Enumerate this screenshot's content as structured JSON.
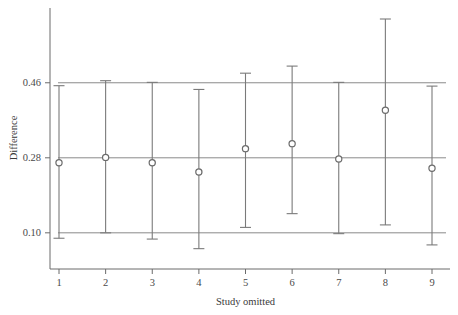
{
  "chart_data": {
    "type": "scatter",
    "title": "",
    "subtitle": "",
    "xlabel": "Study omitted",
    "ylabel": "Difference",
    "categories": [
      "1",
      "2",
      "3",
      "4",
      "5",
      "6",
      "7",
      "8",
      "9"
    ],
    "x": [
      1,
      2,
      3,
      4,
      5,
      6,
      7,
      8,
      9
    ],
    "values": [
      0.268,
      0.281,
      0.268,
      0.246,
      0.302,
      0.314,
      0.277,
      0.394,
      0.255
    ],
    "ci_lower": [
      0.087,
      0.1,
      0.085,
      0.062,
      0.113,
      0.146,
      0.098,
      0.119,
      0.071
    ],
    "ci_upper": [
      0.453,
      0.465,
      0.461,
      0.444,
      0.483,
      0.5,
      0.461,
      0.613,
      0.452
    ],
    "ylim": [
      0.03,
      0.625
    ],
    "xlim": [
      0.5,
      9.5
    ],
    "yticks": [
      0.1,
      0.28,
      0.46
    ],
    "ytick_labels": [
      "0.10",
      "0.28",
      "0.46"
    ],
    "xticks": [
      1,
      2,
      3,
      4,
      5,
      6,
      7,
      8,
      9
    ],
    "xtick_labels": [
      "1",
      "2",
      "3",
      "4",
      "5",
      "6",
      "7",
      "8",
      "9"
    ],
    "reference_lines": [
      {
        "name": "lower-ci-reference",
        "value": 0.1
      },
      {
        "name": "pooled-estimate-reference",
        "value": 0.28
      },
      {
        "name": "upper-ci-reference",
        "value": 0.46
      }
    ],
    "grid": false,
    "legend": null,
    "legend_position": "none",
    "marker": "open-circle",
    "error_bar_style": "capped-vertical",
    "series": [
      {
        "name": "leave-one-out-estimate",
        "values": [
          0.268,
          0.281,
          0.268,
          0.246,
          0.302,
          0.314,
          0.277,
          0.394,
          0.255
        ]
      }
    ],
    "annotations": []
  },
  "colors": {
    "background": "#ffffff",
    "axis": "#6b6b6b",
    "reference_line": "#8a8a8a",
    "error_bar": "#7a7a7a",
    "marker_stroke": "#6b6b6b",
    "marker_fill": "#ffffff",
    "text": "#3a3a3a"
  }
}
